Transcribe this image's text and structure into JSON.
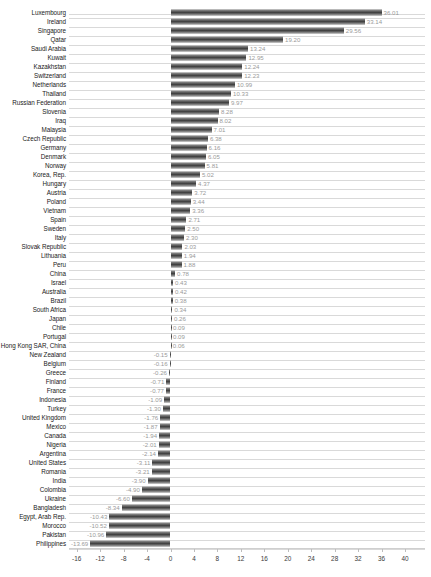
{
  "chart_data": {
    "type": "bar",
    "orientation": "horizontal",
    "title": "",
    "subtitle": "",
    "xlabel": "",
    "ylabel": "",
    "xlim": [
      -16,
      40
    ],
    "xticks": [
      -16,
      -12,
      -8,
      -4,
      0,
      4,
      8,
      12,
      16,
      20,
      24,
      28,
      32,
      36,
      40
    ],
    "xtick_labels": [
      "-16",
      "-12",
      "-8",
      "-4",
      "0",
      "4",
      "8",
      "12",
      "16",
      "20",
      "24",
      "28",
      "32",
      "36",
      "40"
    ],
    "grid": true,
    "legend": "none",
    "bar_color": "#4d4d4d",
    "value_label_color": "#9a9a9a",
    "categories": [
      "Luxembourg",
      "Ireland",
      "Singapore",
      "Qatar",
      "Saudi Arabia",
      "Kuwait",
      "Kazakhstan",
      "Switzerland",
      "Netherlands",
      "Thailand",
      "Russian Federation",
      "Slovenia",
      "Iraq",
      "Malaysia",
      "Czech Republic",
      "Germany",
      "Denmark",
      "Norway",
      "Korea, Rep.",
      "Hungary",
      "Austria",
      "Poland",
      "Vietnam",
      "Spain",
      "Sweden",
      "Italy",
      "Slovak Republic",
      "Lithuania",
      "Peru",
      "China",
      "Israel",
      "Australia",
      "Brazil",
      "South Africa",
      "Japan",
      "Chile",
      "Portugal",
      "Hong Kong SAR, China",
      "New Zealand",
      "Belgium",
      "Greece",
      "Finland",
      "France",
      "Indonesia",
      "Turkey",
      "United Kingdom",
      "Mexico",
      "Canada",
      "Nigeria",
      "Argentina",
      "United States",
      "Romania",
      "India",
      "Colombia",
      "Ukraine",
      "Bangladesh",
      "Egypt, Arab Rep.",
      "Morocco",
      "Pakistan",
      "Philippines"
    ],
    "values": [
      36.01,
      33.14,
      29.56,
      19.2,
      13.24,
      12.95,
      12.24,
      12.23,
      10.99,
      10.33,
      9.97,
      8.28,
      8.02,
      7.01,
      6.38,
      6.16,
      6.05,
      5.81,
      5.02,
      4.37,
      3.72,
      3.44,
      3.36,
      2.71,
      2.5,
      2.3,
      2.03,
      1.94,
      1.88,
      0.78,
      0.43,
      0.42,
      0.38,
      0.34,
      0.26,
      0.09,
      0.09,
      0.06,
      -0.15,
      -0.16,
      -0.26,
      -0.71,
      -0.77,
      -1.09,
      -1.3,
      -1.76,
      -1.87,
      -1.94,
      -2.01,
      -2.14,
      -3.11,
      -3.21,
      -3.9,
      -4.9,
      -6.6,
      -8.34,
      -10.43,
      -10.52,
      -10.96,
      -13.69
    ],
    "value_labels": [
      "36.01",
      "33.14",
      "29.56",
      "19.20",
      "13.24",
      "12.95",
      "12.24",
      "12.23",
      "10.99",
      "10.33",
      "9.97",
      "8.28",
      "8.02",
      "7.01",
      "6.38",
      "6.16",
      "6.05",
      "5.81",
      "5.02",
      "4.37",
      "3.72",
      "3.44",
      "3.36",
      "2.71",
      "2.50",
      "2.30",
      "2.03",
      "1.94",
      "1.88",
      "0.78",
      "0.43",
      "0.42",
      "0.38",
      "0.34",
      "0.26",
      "0.09",
      "0.09",
      "0.06",
      "-0.15",
      "-0.16",
      "-0.26",
      "-0.71",
      "-0.77",
      "-1.09",
      "-1.30",
      "-1.76",
      "-1.87",
      "-1.94",
      "-2.01",
      "-2.14",
      "-3.11",
      "-3.21",
      "-3.90",
      "-4.90",
      "-6.60",
      "-8.34",
      "-10.43",
      "-10.52",
      "-10.96",
      "-13.69"
    ]
  }
}
